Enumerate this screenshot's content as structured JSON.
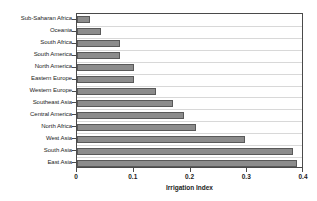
{
  "figure": {
    "top_fragment_text": "",
    "background_color": "#ffffff"
  },
  "chart_data": {
    "type": "bar",
    "orientation": "horizontal",
    "title": "",
    "subtitle": "",
    "xlabel": "Irrigation Index",
    "ylabel": "",
    "xlim": [
      0,
      0.4
    ],
    "xticks": [
      "0",
      "0.1",
      "0.2",
      "0.3",
      "0.4"
    ],
    "xtick_values": [
      0,
      0.1,
      0.2,
      0.3,
      0.4
    ],
    "grid": "horizontal",
    "legend": "none",
    "bar_color": "#8c8c8c",
    "bar_edge_color": "#595959",
    "axis_color": "#4a4a4a",
    "gridline_color": "#d8d8d8",
    "categories": [
      "Sub-Saharan Africa",
      "Oceania",
      "South Africa",
      "South America",
      "North America",
      "Eastern Europe",
      "Western Europe",
      "Southeast Asia",
      "Central America",
      "North Africa",
      "West Asia",
      "South Asia",
      "East Asia"
    ],
    "values": [
      0.023,
      0.043,
      0.076,
      0.076,
      0.1,
      0.1,
      0.139,
      0.169,
      0.189,
      0.209,
      0.296,
      0.38,
      0.387
    ]
  }
}
